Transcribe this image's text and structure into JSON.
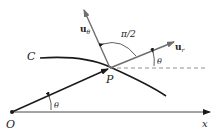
{
  "diagram": {
    "labels": {
      "curve": "C",
      "origin": "O",
      "point": "P",
      "x_axis": "x",
      "theta_bottom": "θ",
      "theta_right": "θ",
      "right_angle": "π/2",
      "u_theta_base": "u",
      "u_theta_sub": "θ",
      "u_r_base": "u",
      "u_r_sub": "r"
    },
    "colors": {
      "line": "#1a1a1a",
      "vector": "#6e6e6e",
      "dashed": "#777777",
      "background": "#ffffff"
    }
  }
}
